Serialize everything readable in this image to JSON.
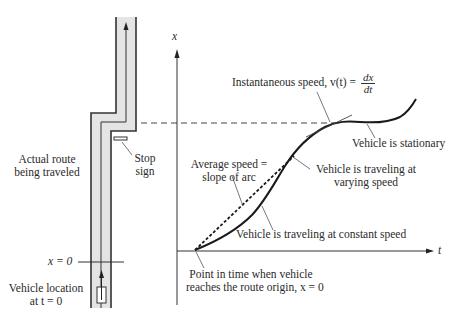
{
  "figure": {
    "route": {
      "label_line1": "Actual route",
      "label_line2": "being traveled",
      "stop_sign_line1": "Stop",
      "stop_sign_line2": "sign",
      "origin_label": "x = 0",
      "vehicle_label_line1": "Vehicle location",
      "vehicle_label_line2": "at t = 0",
      "road_fill": "#e4e4e4",
      "road_edge": "#333333"
    },
    "graph": {
      "y_axis_label": "x",
      "x_axis_label": "t",
      "instantaneous_label": "Instantaneous speed, v(t) = ",
      "derivative_num": "dx",
      "derivative_den": "dt",
      "stationary_label": "Vehicle is stationary",
      "average_line1": "Average speed =",
      "average_line2": "slope of arc",
      "varying_line1": "Vehicle is traveling at",
      "varying_line2": "varying speed",
      "constant_label": "Vehicle is traveling at constant speed",
      "origin_point_line1": "Point in time when vehicle",
      "origin_point_line2": "reaches the route origin, x = 0"
    }
  }
}
